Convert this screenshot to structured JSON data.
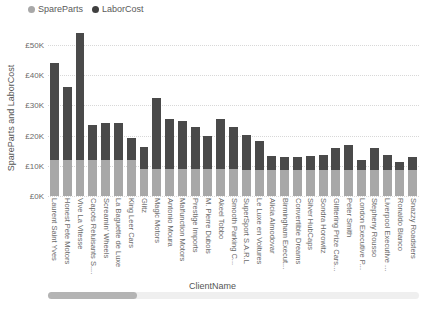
{
  "chart_data": {
    "type": "bar",
    "subtype": "stacked-column",
    "title": "",
    "xlabel": "ClientName",
    "ylabel": "SpareParts and LaborCost",
    "ylim": [
      0,
      55000
    ],
    "grid": true,
    "legend_position": "top-left",
    "ytick_labels": [
      "£50K",
      "£40K",
      "£30K",
      "£20K",
      "£10K",
      "£0K"
    ],
    "ytick_values": [
      50000,
      40000,
      30000,
      20000,
      10000,
      0
    ],
    "categories": [
      "Laurent Saint Yves",
      "Honest Pete Motors",
      "Vive La Vitesse",
      "Capots Reluisants S....",
      "Screamin' Wheels",
      "La Baguette de Luxe",
      "King Leer Cars",
      "Glitz",
      "Magic Motors",
      "Antonio Moura",
      "Malfunction Motors",
      "Prestige Imports",
      "M. Pierre Dubois",
      "Akeel Tobbo",
      "Smooth Parking C...",
      "SuperSport S.A.R.L",
      "Le Luxe en Voitures",
      "Alicia Almodovar",
      "Birmingham Execut...",
      "Convertible Dreams",
      "Silver HubCaps",
      "Sondra Horowitz",
      "Glittering Prize Cars...",
      "Peter Smith",
      "London Executive P...",
      "Stepheny Rousso",
      "Liverpool Executive ...",
      "Ronaldo Bianco",
      "Snazzy Roadsters"
    ],
    "series": [
      {
        "name": "SpareParts",
        "color": "#a8a8a8",
        "values": [
          11800,
          11800,
          11800,
          11800,
          11800,
          11800,
          11800,
          8800,
          8800,
          8800,
          8800,
          8800,
          8800,
          8800,
          8800,
          8500,
          8500,
          8500,
          8500,
          8500,
          8500,
          8500,
          8500,
          8500,
          8500,
          8500,
          8500,
          8500,
          8500
        ]
      },
      {
        "name": "LaborCost",
        "color": "#4a4a4a",
        "values": [
          32200,
          24200,
          42200,
          11700,
          12400,
          12400,
          7400,
          7400,
          23700,
          16700,
          16100,
          14200,
          11100,
          16700,
          14100,
          11700,
          9700,
          4900,
          4300,
          4300,
          4800,
          5100,
          7400,
          8400,
          3500,
          7500,
          5000,
          2900,
          4500
        ]
      }
    ],
    "totals": [
      44000,
      36000,
      54000,
      23500,
      24200,
      24200,
      19200,
      16200,
      32500,
      25500,
      24900,
      23000,
      19900,
      25500,
      22900,
      20200,
      18200,
      13400,
      12800,
      12800,
      13300,
      13600,
      15900,
      16900,
      12000,
      16000,
      13500,
      11400,
      13000
    ]
  },
  "legend": {
    "items": [
      {
        "label": "SpareParts",
        "color": "#a8a8a8"
      },
      {
        "label": "LaborCost",
        "color": "#4a4a4a"
      }
    ]
  },
  "scrollbar": {
    "thumb_position_percent": 0,
    "thumb_width_percent": 24
  }
}
